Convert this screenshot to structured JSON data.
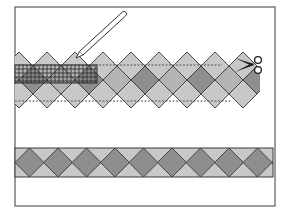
{
  "figure": {
    "title": "Cutting a pieced diamond strip with a ruler and scissors",
    "frame": {
      "x": 15,
      "y": 7,
      "w": 260,
      "h": 199
    }
  },
  "colors": {
    "frame": "#5a5a5a",
    "outline": "#3a3a3a",
    "light_fill": "#c8c8c8",
    "mid_fill": "#b4b4b4",
    "dark_fill": "#8e8e8e",
    "ruler_grid": "#2a2a2a",
    "dotted_line": "#555555",
    "background": "#ffffff"
  },
  "upper_strip": {
    "x_start": 15,
    "pitch": 28,
    "half": 14,
    "top_y": 52,
    "row_count": 3,
    "cut_line_top_y": 65,
    "cut_line_bottom_y": 101,
    "columns": 9
  },
  "ruler": {
    "x": 15,
    "y": 65,
    "w": 82,
    "h": 18,
    "grid_spacing": 4
  },
  "pencil": {
    "tip": [
      76,
      58
    ],
    "end": [
      124,
      14
    ],
    "width": 5
  },
  "scissors": {
    "x": 235,
    "y": 56,
    "label": "scissors-icon"
  },
  "lower_strip": {
    "x": 15,
    "y": 148,
    "w": 258,
    "h": 29,
    "pitch": 28.5,
    "count": 9
  },
  "icons": {
    "pencil": "pencil-icon",
    "scissors": "scissors-icon",
    "ruler": "ruler-icon"
  }
}
